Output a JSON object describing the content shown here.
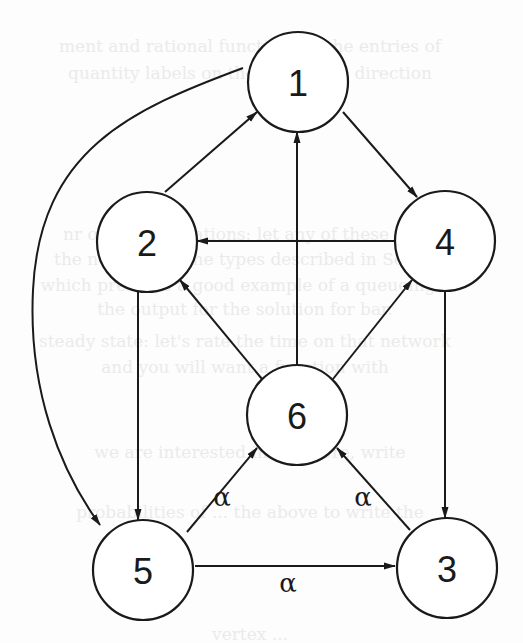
{
  "diagram": {
    "type": "directed-graph",
    "colors": {
      "stroke": "#1a1a1a",
      "node_fill": "#ffffff",
      "background": "#fdfdfd"
    },
    "node_radius": 50,
    "nodes": [
      {
        "id": "1",
        "label": "1",
        "x": 298,
        "y": 82
      },
      {
        "id": "2",
        "label": "2",
        "x": 147,
        "y": 242
      },
      {
        "id": "3",
        "label": "3",
        "x": 447,
        "y": 568
      },
      {
        "id": "4",
        "label": "4",
        "x": 445,
        "y": 241
      },
      {
        "id": "5",
        "label": "5",
        "x": 143,
        "y": 570
      },
      {
        "id": "6",
        "label": "6",
        "x": 297,
        "y": 415
      }
    ],
    "edges": [
      {
        "from": "2",
        "to": "1",
        "label": "",
        "path": "M165,192 L257,112"
      },
      {
        "from": "1",
        "to": "4",
        "label": "",
        "path": "M343,112 L417,197"
      },
      {
        "from": "4",
        "to": "2",
        "label": "",
        "path": "M395,241 L197,241"
      },
      {
        "from": "6",
        "to": "1",
        "label": "",
        "path": "M297,365 L297,132"
      },
      {
        "from": "6",
        "to": "2",
        "label": "",
        "path": "M262,379 L180,280"
      },
      {
        "from": "6",
        "to": "4",
        "label": "",
        "path": "M333,379 L412,280"
      },
      {
        "from": "2",
        "to": "5",
        "label": "",
        "path": "M138,292 L138,520"
      },
      {
        "from": "4",
        "to": "3",
        "label": "",
        "path": "M445,291 L445,518"
      },
      {
        "from": "1",
        "to": "5",
        "label": "",
        "path": "M243,68 C130,110 40,150 33,290 C28,390 60,470 100,525"
      },
      {
        "from": "5",
        "to": "6",
        "label": "α",
        "path": "M187,532 L257,448",
        "label_x": 222,
        "label_y": 497
      },
      {
        "from": "3",
        "to": "6",
        "label": "α",
        "path": "M410,530 L337,448",
        "label_x": 363,
        "label_y": 497
      },
      {
        "from": "5",
        "to": "3",
        "label": "α",
        "path": "M195,566 L395,566",
        "label_x": 288,
        "label_y": 583
      }
    ]
  },
  "background_bleed": {
    "lines": [
      {
        "text": "ment and rational functions of the entries of",
        "x": 250,
        "y": 52
      },
      {
        "text": "quantity labels on the edges and direction",
        "x": 250,
        "y": 79
      },
      {
        "text": "nr of these equations: let any of these stat",
        "x": 245,
        "y": 240
      },
      {
        "text": "the network of the types described in Sectio",
        "x": 245,
        "y": 265
      },
      {
        "text": "which presents a good example of a queueing s",
        "x": 245,
        "y": 291
      },
      {
        "text": "the output for the solution for bar.",
        "x": 245,
        "y": 315
      },
      {
        "text": "steady state: let's rate the time on that network",
        "x": 245,
        "y": 347
      },
      {
        "text": "and you will want a function with",
        "x": 245,
        "y": 373
      },
      {
        "text": "we are interested in and here, write",
        "x": 250,
        "y": 458
      },
      {
        "text": "probabilities of ... the above to write the",
        "x": 250,
        "y": 518
      },
      {
        "text": "vertex ...",
        "x": 250,
        "y": 640
      }
    ]
  }
}
